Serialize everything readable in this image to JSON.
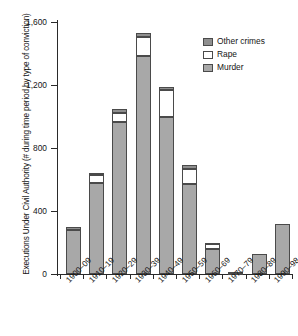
{
  "chart_data": {
    "type": "bar",
    "subtype": "stacked-bar",
    "title": "",
    "xlabel": "",
    "ylabel": "Executions Under Civil Authority (# during time period by type of conviction)",
    "categories": [
      "1900–09",
      "1910–19",
      "1920–29",
      "1930–39",
      "1940–49",
      "1950–59",
      "1960–69",
      "1970–79",
      "1980–89",
      "1990–98"
    ],
    "series": [
      {
        "name": "Murder",
        "color": "#a8a8a8",
        "values": [
          280,
          575,
          965,
          1385,
          995,
          570,
          160,
          8,
          125,
          320
        ]
      },
      {
        "name": "Rape",
        "color": "#ffffff",
        "values": [
          0,
          55,
          55,
          120,
          175,
          95,
          30,
          0,
          0,
          0
        ]
      },
      {
        "name": "Other crimes",
        "color": "#8f8f8f",
        "values": [
          20,
          10,
          25,
          25,
          20,
          25,
          10,
          2,
          0,
          0
        ]
      }
    ],
    "totals": [
      300,
      640,
      1045,
      1530,
      1190,
      690,
      200,
      10,
      125,
      320
    ],
    "ylim": [
      0,
      1600
    ],
    "yticks": [
      0,
      400,
      800,
      1200,
      1600
    ],
    "ytick_labels": [
      "0",
      "400",
      "800",
      "1,200",
      "1,600"
    ],
    "grid": false,
    "legend_position": "top-right",
    "legend_order": [
      "Other crimes",
      "Rape",
      "Murder"
    ]
  },
  "axes": {
    "y_title": "Executions Under Civil Authority (# during time period by type of conviction)"
  },
  "legend": {
    "items": [
      {
        "label": "Other crimes",
        "color": "#8f8f8f"
      },
      {
        "label": "Rape",
        "color": "#ffffff"
      },
      {
        "label": "Murder",
        "color": "#a8a8a8"
      }
    ]
  }
}
